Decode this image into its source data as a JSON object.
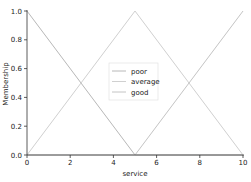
{
  "chart_data": {
    "type": "line",
    "title": "",
    "xlabel": "service",
    "ylabel": "Membership",
    "xlim": [
      0,
      10
    ],
    "ylim": [
      0,
      1.0
    ],
    "xticks": [
      "0",
      "2",
      "4",
      "6",
      "8",
      "10"
    ],
    "yticks": [
      "0.0",
      "0.2",
      "0.4",
      "0.6",
      "0.8",
      "1.0"
    ],
    "grid": false,
    "legend_position": "center",
    "series": [
      {
        "name": "poor",
        "color": "#b8b8b8",
        "x": [
          0,
          5,
          10
        ],
        "y": [
          1.0,
          0.0,
          0.0
        ]
      },
      {
        "name": "average",
        "color": "#d0d0d0",
        "x": [
          0,
          5,
          10
        ],
        "y": [
          0.0,
          1.0,
          0.0
        ]
      },
      {
        "name": "good",
        "color": "#c4c4c4",
        "x": [
          0,
          5,
          10
        ],
        "y": [
          0.0,
          0.0,
          1.0
        ]
      }
    ]
  },
  "legend": {
    "items": [
      "poor",
      "average",
      "good"
    ]
  }
}
